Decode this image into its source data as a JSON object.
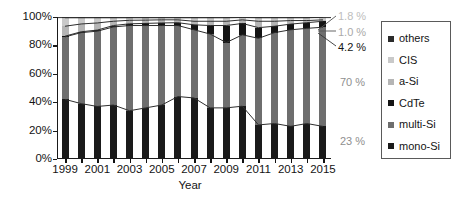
{
  "chart_data": {
    "type": "bar",
    "subtype": "100% stacked bar with connector lines",
    "title": "",
    "xlabel": "Year",
    "ylabel": "",
    "ylim": [
      0,
      100
    ],
    "yticks": [
      "0%",
      "20%",
      "40%",
      "60%",
      "80%",
      "100%"
    ],
    "ytick_values": [
      0,
      20,
      40,
      60,
      80,
      100
    ],
    "grid": false,
    "legend_position": "right",
    "categories": [
      "1999",
      "2000",
      "2001",
      "2002",
      "2003",
      "2004",
      "2005",
      "2006",
      "2007",
      "2008",
      "2009",
      "2010",
      "2011",
      "2012",
      "2013",
      "2014",
      "2015"
    ],
    "xtick_labels": [
      "1999",
      "",
      "2001",
      "",
      "2003",
      "",
      "2005",
      "",
      "2007",
      "",
      "2009",
      "",
      "2011",
      "",
      "2013",
      "",
      "2015"
    ],
    "series": [
      {
        "name": "mono-Si",
        "color": "#1a1a1a",
        "values": [
          42,
          39,
          37,
          38,
          34,
          36,
          38,
          44,
          43,
          36,
          36,
          37,
          24,
          25,
          23,
          25,
          23
        ]
      },
      {
        "name": "multi-Si",
        "color": "#6e6e6e",
        "values": [
          44,
          50,
          53,
          55,
          60,
          58,
          56,
          50,
          48,
          52,
          46,
          50,
          61,
          64,
          68,
          67,
          70
        ]
      },
      {
        "name": "CdTe",
        "color": "#141414",
        "values": [
          0.5,
          0.6,
          0.8,
          1.0,
          1.2,
          1.5,
          1.8,
          2.0,
          3.5,
          6.0,
          12.0,
          8.0,
          7.5,
          4.5,
          4.0,
          4.0,
          4.2
        ]
      },
      {
        "name": "a-Si",
        "color": "#b5b5b5",
        "values": [
          7.0,
          5.5,
          5.0,
          3.0,
          2.5,
          2.3,
          2.2,
          2.0,
          2.5,
          3.0,
          3.0,
          2.5,
          4.5,
          3.5,
          2.5,
          1.5,
          1.0
        ]
      },
      {
        "name": "CIS",
        "color": "#c9c9c9",
        "values": [
          6.0,
          4.4,
          3.7,
          2.5,
          1.8,
          1.7,
          1.5,
          1.5,
          2.5,
          2.5,
          2.5,
          1.7,
          2.5,
          2.5,
          2.0,
          2.0,
          1.8
        ]
      },
      {
        "name": "others",
        "color": "#2b2b2b",
        "values": [
          0.5,
          0.5,
          0.5,
          0.5,
          0.5,
          0.5,
          0.5,
          0.5,
          0.5,
          0.5,
          0.5,
          0.3,
          0.5,
          0.5,
          0.5,
          0.5,
          0.2
        ]
      }
    ],
    "annotations": [
      {
        "text": "1.8 %",
        "series": "CIS",
        "tone": "lightgray"
      },
      {
        "text": "1.0 %",
        "series": "a-Si",
        "tone": "gray"
      },
      {
        "text": "4.2 %",
        "series": "CdTe",
        "tone": "dark"
      },
      {
        "text": "70 %",
        "series": "multi-Si",
        "tone": "midgray"
      },
      {
        "text": "23 %",
        "series": "mono-Si",
        "tone": "midgray"
      }
    ]
  },
  "axis": {
    "x_title": "Year",
    "y_ticks": [
      "100%",
      "80%",
      "60%",
      "40%",
      "20%",
      "0%"
    ]
  },
  "legend": {
    "items": [
      {
        "label": "others",
        "color": "#2b2b2b"
      },
      {
        "label": "CIS",
        "color": "#c9c9c9"
      },
      {
        "label": "a-Si",
        "color": "#b5b5b5"
      },
      {
        "label": "CdTe",
        "color": "#141414"
      },
      {
        "label": "multi-Si",
        "color": "#6e6e6e"
      },
      {
        "label": "mono-Si",
        "color": "#1a1a1a"
      }
    ]
  },
  "annotations": {
    "cis_value": "1.8 %",
    "asi_value": "1.0 %",
    "cdte_value": "4.2 %",
    "multisi_value": "70 %",
    "monosi_value": "23 %"
  }
}
